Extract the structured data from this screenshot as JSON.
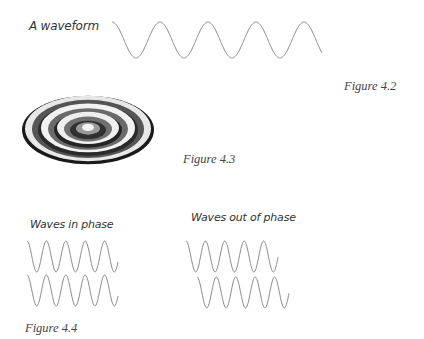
{
  "figure_4_2": {
    "label": "A waveform",
    "caption": "Figure 4.2",
    "wave": {
      "x0": 112,
      "x1": 322,
      "y_top": 22,
      "y_bottom": 58,
      "period": 48,
      "phase": 0.25
    }
  },
  "figure_4_3": {
    "caption": "Figure 4.3",
    "rings_description": "3D ripple pattern of concentric circular waves"
  },
  "figure_4_4": {
    "caption": "Figure 4.4",
    "in_phase": {
      "label": "Waves in phase",
      "waves": [
        {
          "x0": 27,
          "x1": 118,
          "y_top": 241,
          "y_bottom": 272,
          "period": 19.4
        },
        {
          "x0": 27,
          "x1": 118,
          "y_top": 275,
          "y_bottom": 306,
          "period": 19.4
        }
      ]
    },
    "out_of_phase": {
      "label": "Waves out of phase",
      "waves": [
        {
          "x0": 186,
          "x1": 278,
          "y_top": 241,
          "y_bottom": 272,
          "period": 19.4
        },
        {
          "x0": 197,
          "x1": 289,
          "y_top": 277,
          "y_bottom": 308,
          "period": 19.4
        }
      ]
    }
  },
  "colors": {
    "stroke": "#8a8a8a",
    "text": "#333333"
  }
}
